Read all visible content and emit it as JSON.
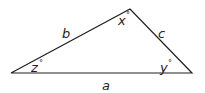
{
  "diagram": {
    "type": "triangle",
    "stroke_color": "#231f20",
    "vertices": {
      "left": [
        11,
        73
      ],
      "top": [
        130,
        9
      ],
      "right": [
        192,
        73
      ]
    },
    "sides": {
      "a": {
        "label": "a",
        "between": [
          "left",
          "right"
        ]
      },
      "b": {
        "label": "b",
        "between": [
          "left",
          "top"
        ]
      },
      "c": {
        "label": "c",
        "between": [
          "top",
          "right"
        ]
      }
    },
    "angles": {
      "x": {
        "label": "x",
        "unit": "°",
        "vertex": "top"
      },
      "y": {
        "label": "y",
        "unit": "°",
        "vertex": "right"
      },
      "z": {
        "label": "z",
        "unit": "°",
        "vertex": "left"
      }
    }
  }
}
